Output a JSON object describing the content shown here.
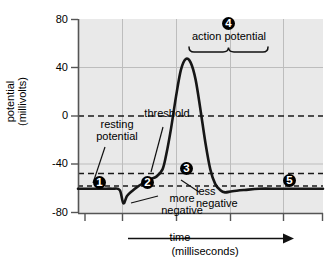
{
  "chart_data": {
    "type": "line",
    "title": "",
    "xlabel": "time",
    "xlabel_units": "(milliseconds)",
    "ylabel": "potential",
    "ylabel_units": "(millivolts)",
    "ylim": [
      -80,
      80
    ],
    "yticks": [
      80,
      40,
      0,
      -40,
      -80
    ],
    "ytick_labels": [
      "80",
      "40",
      "0",
      "-40",
      "-80"
    ],
    "xticks": [],
    "xtick_labels": [],
    "grid": true,
    "legend": "none",
    "reference_lines": [
      {
        "name": "zero-line",
        "value": 0,
        "style": "dashed"
      },
      {
        "name": "threshold-line",
        "value": -50,
        "style": "dashed"
      },
      {
        "name": "resting-line",
        "value": -60,
        "style": "dashed"
      }
    ],
    "series": [
      {
        "name": "membrane potential",
        "x": [
          0.0,
          0.5,
          1.0,
          1.4,
          1.7,
          1.85,
          2.0,
          2.2,
          2.45,
          2.7,
          2.95,
          3.2,
          3.45,
          3.6,
          3.8,
          4.0,
          4.2,
          4.4,
          4.6,
          4.8,
          5.0,
          5.2,
          5.4,
          5.6,
          5.8,
          6.0,
          6.3,
          6.8,
          7.4,
          8.2,
          9.2,
          10.0
        ],
        "values": [
          -60,
          -60,
          -60,
          -60,
          -61,
          -72,
          -66,
          -62,
          -58,
          -55,
          -52,
          -50,
          -44,
          -32,
          -10,
          16,
          38,
          47,
          44,
          30,
          5,
          -22,
          -44,
          -56,
          -61,
          -63,
          -62,
          -61,
          -60,
          -60,
          -60,
          -60
        ]
      }
    ],
    "annotations": [
      {
        "id": "1",
        "label": "resting potential",
        "marker": "❶"
      },
      {
        "id": "2",
        "label": "more negative",
        "marker": "❷"
      },
      {
        "id": "3",
        "label": "less negative",
        "marker": "❸"
      },
      {
        "id": "4",
        "label": "action potential",
        "marker": "❹"
      },
      {
        "id": "5",
        "label": "",
        "marker": "❺"
      }
    ]
  },
  "axis": {
    "y_title_line1": "potential",
    "y_title_line2": "(millivolts)",
    "x_title": "time",
    "x_title_units": "(milliseconds)",
    "ytick_80": "80",
    "ytick_40": "40",
    "ytick_0": "0",
    "ytick_m40": "-40",
    "ytick_m80": "-80"
  },
  "labels": {
    "resting_potential_line1": "resting",
    "resting_potential_line2": "potential",
    "threshold": "threshold",
    "more_negative_line1": "more",
    "more_negative_line2": "negative",
    "less_negative_line1": "less",
    "less_negative_line2": "negative",
    "action_potential": "action potential"
  },
  "markers": {
    "m1": "1",
    "m2": "2",
    "m3": "3",
    "m4": "4",
    "m5": "5"
  },
  "colors": {
    "plot_bg": "#e8e8e8",
    "curve": "#1a1a1a",
    "grid": "#b9b9b9",
    "axis": "#4a4a4a",
    "text": "#000000"
  }
}
